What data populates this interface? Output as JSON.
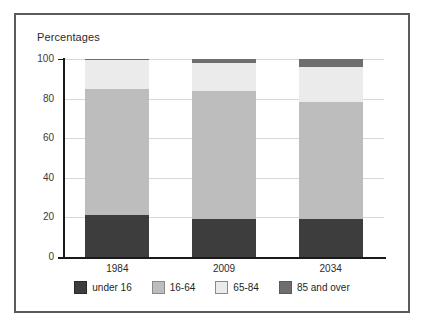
{
  "chart_data": {
    "type": "bar",
    "subtype": "stacked-100-percent",
    "title": "",
    "ylabel": "Percentages",
    "xlabel": "",
    "ylim": [
      0,
      100
    ],
    "yticks": [
      0,
      20,
      40,
      60,
      80,
      100
    ],
    "grid": true,
    "legend_position": "bottom",
    "categories": [
      "1984",
      "2009",
      "2034"
    ],
    "series": [
      {
        "name": "under 16",
        "color": "#3d3d3d",
        "values": [
          21.0,
          19.0,
          19.0
        ]
      },
      {
        "name": "16-64",
        "color": "#bdbdbd",
        "values": [
          64.0,
          65.0,
          59.5
        ]
      },
      {
        "name": "65-84",
        "color": "#ebebeb",
        "values": [
          14.5,
          14.0,
          17.5
        ]
      },
      {
        "name": "85 and over",
        "color": "#6e6e6e",
        "values": [
          0.5,
          2.0,
          4.0
        ]
      }
    ]
  },
  "axis": {
    "title": "Percentages",
    "ytick_labels": [
      "100",
      "80",
      "60",
      "40",
      "20",
      "0"
    ],
    "xtick_labels": [
      "1984",
      "2009",
      "2034"
    ]
  },
  "legend": {
    "items": [
      {
        "label": "under 16",
        "color": "#3d3d3d"
      },
      {
        "label": "16-64",
        "color": "#bdbdbd"
      },
      {
        "label": "65-84",
        "color": "#ebebeb"
      },
      {
        "label": "85 and over",
        "color": "#6e6e6e"
      }
    ]
  },
  "colors": {
    "border": "#5a5a60",
    "axis": "#1a1a1a",
    "grid": "#d8d8d8",
    "background": "#ffffff"
  }
}
